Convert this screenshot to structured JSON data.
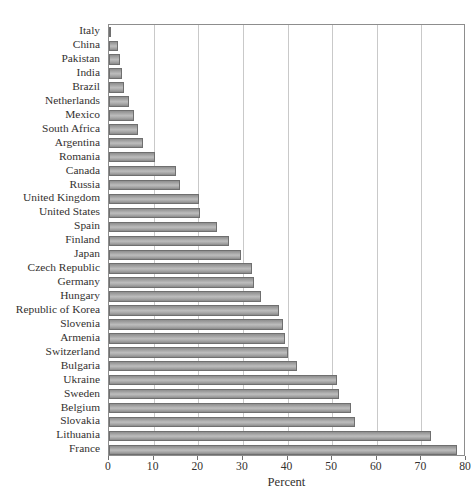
{
  "chart_data": {
    "type": "bar",
    "orientation": "horizontal",
    "title": "",
    "xlabel": "Percent",
    "ylabel": "",
    "xlim": [
      0,
      80
    ],
    "xticks": [
      0,
      10,
      20,
      30,
      40,
      50,
      60,
      70,
      80
    ],
    "xtick_labels": [
      "0",
      "10",
      "20",
      "30",
      "40",
      "50",
      "60",
      "70",
      "80"
    ],
    "grid": "vertical",
    "legend": "none",
    "bar_color": "#ababab",
    "bar_edge_color": "#6f6f6f",
    "frame_color": "#8d8d8d",
    "gridline_color": "#c9c9c9",
    "background": "#ffffff",
    "categories": [
      "Italy",
      "China",
      "Pakistan",
      "India",
      "Brazil",
      "Netherlands",
      "Mexico",
      "South Africa",
      "Argentina",
      "Romania",
      "Canada",
      "Russia",
      "United Kingdom",
      "United States",
      "Spain",
      "Finland",
      "Japan",
      "Czech Republic",
      "Germany",
      "Hungary",
      "Republic of Korea",
      "Slovenia",
      "Armenia",
      "Switzerland",
      "Bulgaria",
      "Ukraine",
      "Sweden",
      "Belgium",
      "Slovakia",
      "Lithuania",
      "France"
    ],
    "values": [
      0.4,
      2.0,
      2.5,
      3.0,
      3.4,
      4.4,
      5.6,
      6.6,
      7.6,
      10.2,
      15.0,
      16.0,
      20.2,
      20.4,
      24.2,
      27.0,
      29.6,
      32.0,
      32.6,
      34.0,
      38.0,
      39.0,
      39.4,
      40.2,
      42.2,
      51.0,
      51.6,
      54.2,
      55.2,
      72.2,
      78.0
    ]
  }
}
